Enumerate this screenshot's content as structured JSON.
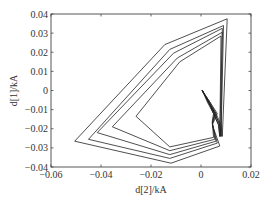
{
  "chart_data": {
    "type": "line",
    "title": "",
    "xlabel": "d[2]/kA",
    "ylabel": "d[1]/kA",
    "xlim": [
      -0.06,
      0.02
    ],
    "ylim": [
      -0.04,
      0.04
    ],
    "xticks": [
      -0.06,
      -0.04,
      -0.02,
      0,
      0.02
    ],
    "xtick_labels": [
      "−0.06",
      "−0.04",
      "−0.02",
      "0",
      "0.02"
    ],
    "yticks": [
      0.04,
      0.03,
      0.02,
      0.01,
      0,
      -0.01,
      -0.02,
      -0.03,
      -0.04
    ],
    "ytick_labels": [
      "0.04",
      "0.03",
      "0.02",
      "0.01",
      "0",
      "−0.01",
      "−0.02",
      "−0.03",
      "−0.04"
    ],
    "grid": false,
    "legend": null,
    "line_color": "#222222",
    "series": [
      {
        "name": "loop-1",
        "x": [
          0.0005,
          0.003,
          0.006,
          0.008,
          0.0085,
          0.0105,
          -0.0145,
          -0.0505,
          -0.012,
          0.0075,
          0.0045,
          0.0065,
          0.0035,
          0.0005
        ],
        "y": [
          0.0,
          -0.006,
          -0.012,
          -0.018,
          -0.024,
          0.0375,
          0.024,
          -0.0265,
          -0.038,
          -0.029,
          -0.018,
          -0.012,
          -0.006,
          0.0
        ]
      },
      {
        "name": "loop-2",
        "x": [
          0.0005,
          0.003,
          0.0055,
          0.0075,
          0.008,
          0.009,
          -0.0125,
          -0.045,
          -0.0125,
          0.0065,
          0.0045,
          0.006,
          0.0035,
          0.0005
        ],
        "y": [
          0.0,
          -0.006,
          -0.012,
          -0.018,
          -0.024,
          0.034,
          0.0215,
          -0.0255,
          -0.0355,
          -0.0275,
          -0.0175,
          -0.012,
          -0.006,
          0.0
        ]
      },
      {
        "name": "loop-3",
        "x": [
          0.0005,
          0.003,
          0.0055,
          0.0075,
          0.008,
          0.0085,
          -0.011,
          -0.0415,
          -0.0125,
          0.006,
          0.0045,
          0.0055,
          0.003,
          0.0005
        ],
        "y": [
          0.0,
          -0.006,
          -0.012,
          -0.018,
          -0.024,
          0.0325,
          0.0195,
          -0.022,
          -0.0335,
          -0.0265,
          -0.017,
          -0.012,
          -0.006,
          0.0
        ]
      },
      {
        "name": "loop-4",
        "x": [
          0.0005,
          0.003,
          0.005,
          0.007,
          0.0075,
          0.0085,
          -0.0095,
          -0.0355,
          -0.0125,
          0.0055,
          0.0045,
          0.0055,
          0.003,
          0.0005
        ],
        "y": [
          0.0,
          -0.006,
          -0.012,
          -0.018,
          -0.024,
          0.0305,
          0.017,
          -0.019,
          -0.0315,
          -0.0255,
          -0.0165,
          -0.012,
          -0.006,
          0.0
        ]
      },
      {
        "name": "loop-5",
        "x": [
          0.0005,
          0.0025,
          0.005,
          0.007,
          0.0075,
          0.008,
          -0.0085,
          -0.026,
          -0.0125,
          0.005,
          0.0045,
          0.005,
          0.003,
          0.0005
        ],
        "y": [
          0.0,
          -0.006,
          -0.012,
          -0.018,
          -0.024,
          0.0285,
          0.015,
          -0.0135,
          -0.0295,
          -0.0245,
          -0.016,
          -0.012,
          -0.006,
          0.0
        ]
      }
    ]
  },
  "plot": {
    "area": {
      "left": 51,
      "top": 14,
      "right": 251,
      "bottom": 167
    }
  }
}
